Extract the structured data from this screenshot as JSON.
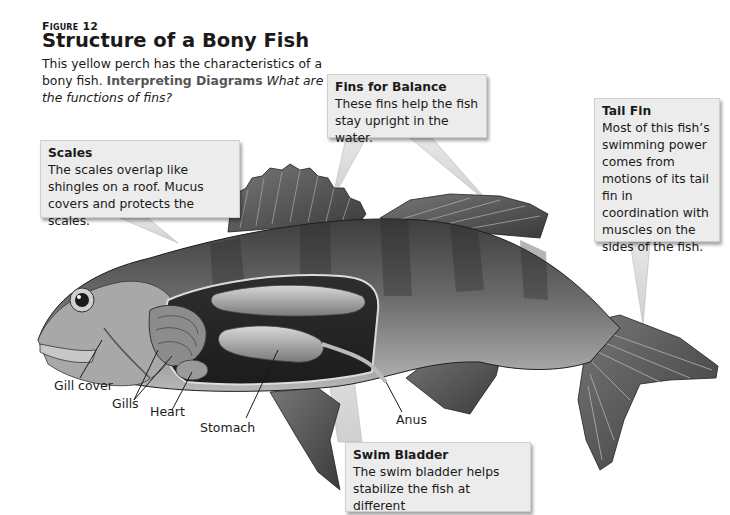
{
  "figure": {
    "label_prefix": "Figure",
    "label_number": "12",
    "title": "Structure of a Bony Fish",
    "caption_text": "This yellow perch has the characteristics of a bony fish.",
    "caption_lead": "Interpreting Diagrams",
    "caption_question": "What are the functions of fins?"
  },
  "callouts": {
    "scales": {
      "title": "Scales",
      "text": "The scales overlap like shingles on a roof. Mucus covers and protects the scales."
    },
    "fins_balance": {
      "title": "Fins for Balance",
      "text": "These fins help the fish stay upright in the water."
    },
    "tail_fin": {
      "title": "Tail Fin",
      "text": "Most of this fish’s swimming power comes from motions of its tail fin in coordination with muscles on the sides of the fish."
    },
    "swim_bladder": {
      "title": "Swim Bladder",
      "text": "The swim bladder helps stabilize the fish at different"
    }
  },
  "labels": {
    "gill_cover": "Gill cover",
    "gills": "Gills",
    "heart": "Heart",
    "stomach": "Stomach",
    "anus": "Anus"
  },
  "colors": {
    "callout_bg": "#ececec",
    "caption_lead": "#555555",
    "body_dark": "#4a4a4a",
    "body_light": "#9a9a9a"
  }
}
